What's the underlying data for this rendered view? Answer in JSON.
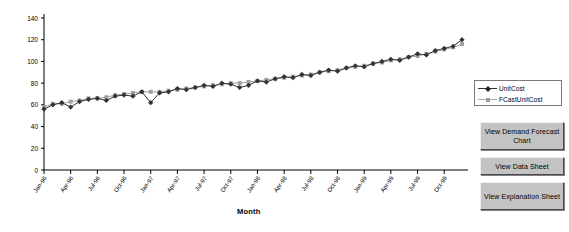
{
  "chart_data": {
    "type": "line",
    "title": "",
    "xlabel": "Month",
    "ylabel": "",
    "ylim": [
      0,
      140
    ],
    "ytick_step": 20,
    "yticks": [
      0,
      20,
      40,
      60,
      80,
      100,
      120,
      140
    ],
    "grid": false,
    "legend_position": "right",
    "x": [
      "Jan-96",
      "Feb-96",
      "Mar-96",
      "Apr-96",
      "May-96",
      "Jun-96",
      "Jul-96",
      "Aug-96",
      "Sep-96",
      "Oct-96",
      "Nov-96",
      "Dec-96",
      "Jan-97",
      "Feb-97",
      "Mar-97",
      "Apr-97",
      "May-97",
      "Jun-97",
      "Jul-97",
      "Aug-97",
      "Sep-97",
      "Oct-97",
      "Nov-97",
      "Dec-97",
      "Jan-98",
      "Feb-98",
      "Mar-98",
      "Apr-98",
      "May-98",
      "Jun-98",
      "Jul-98",
      "Aug-98",
      "Sep-98",
      "Oct-98",
      "Nov-98",
      "Dec-98",
      "Jan-99",
      "Feb-99",
      "Mar-99",
      "Apr-99",
      "May-99",
      "Jun-99",
      "Jul-99",
      "Aug-99",
      "Sep-99",
      "Oct-99",
      "Nov-99",
      "Dec-99"
    ],
    "xticklabels": [
      "Jan-96",
      "Apr-96",
      "Jul-96",
      "Oct-96",
      "Jan-97",
      "Apr-97",
      "Jul-97",
      "Oct-97",
      "Jan-98",
      "Apr-98",
      "Jul-98",
      "Oct-98",
      "Jan-99",
      "Apr-99",
      "Jul-99",
      "Oct-99"
    ],
    "xtick_every": 3,
    "series": [
      {
        "name": "UnitCost",
        "color": "#333333",
        "marker": "diamond",
        "values": [
          56,
          60,
          62,
          58,
          63,
          65,
          66,
          64,
          68,
          69,
          68,
          72,
          62,
          71,
          72,
          75,
          74,
          76,
          78,
          77,
          80,
          79,
          76,
          78,
          82,
          81,
          84,
          86,
          85,
          88,
          87,
          90,
          92,
          91,
          94,
          96,
          95,
          98,
          100,
          102,
          101,
          104,
          107,
          106,
          110,
          112,
          114,
          120
        ]
      },
      {
        "name": "FCastUnitCost",
        "color": "#a0a0a0",
        "marker": "square",
        "values": [
          58,
          61,
          61,
          63,
          64,
          66,
          66,
          67,
          69,
          70,
          71,
          72,
          72,
          72,
          73,
          74,
          75,
          76,
          77,
          78,
          79,
          80,
          80,
          81,
          82,
          83,
          84,
          85,
          86,
          87,
          88,
          90,
          91,
          92,
          94,
          95,
          96,
          98,
          99,
          101,
          102,
          104,
          105,
          107,
          109,
          111,
          113,
          116
        ]
      }
    ]
  },
  "legend": {
    "entries": [
      {
        "label": "UnitCost"
      },
      {
        "label": "FCastUnitCost"
      }
    ]
  },
  "buttons": {
    "forecast_chart": "View Demand Forecast Chart",
    "data_sheet": "View Data Sheet",
    "explanation_sheet": "View Explanation Sheet"
  }
}
